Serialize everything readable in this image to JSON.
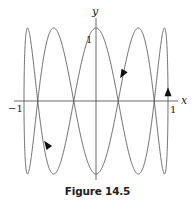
{
  "chart_data": {
    "type": "line",
    "subtype": "parametric (Lissajous curve)",
    "equation": {
      "x": "sin(t)",
      "y": "cos(5t)",
      "t_range": [
        0,
        6.2832
      ]
    },
    "title": "",
    "caption": "Figure 14.5",
    "xlabel": "x",
    "ylabel": "y",
    "xlim": [
      -1,
      1
    ],
    "ylim": [
      -1,
      1
    ],
    "x_tick_labels": [
      {
        "value": -1,
        "label": "−1"
      },
      {
        "value": 1,
        "label": "1"
      }
    ],
    "y_tick_labels": [
      {
        "value": 1,
        "label": "1"
      }
    ],
    "grid": false,
    "legend": null,
    "direction_arrows": [
      {
        "x": 0.37,
        "y": 0.37,
        "direction": "down-left"
      },
      {
        "x": -0.68,
        "y": -0.6,
        "direction": "up-left"
      },
      {
        "x": 1.0,
        "y": 0.12,
        "direction": "up"
      }
    ],
    "line_color": "#555555"
  },
  "figure": {
    "caption": "Figure 14.5",
    "axis_x_label": "x",
    "axis_y_label": "y",
    "tick_x_neg": "−1",
    "tick_x_pos": "1",
    "tick_y_pos": "1"
  }
}
